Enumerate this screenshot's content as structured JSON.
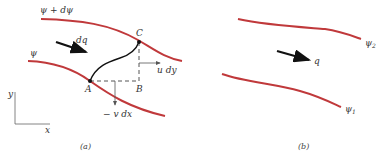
{
  "colors": {
    "streamline": "#c0393b",
    "ink": "#111111",
    "guide": "#555555"
  },
  "panel_a": {
    "caption": "(a)",
    "streamline_upper_label": "ψ + dψ",
    "streamline_lower_label": "ψ",
    "flow_label": "dq",
    "point_a": "A",
    "point_b": "B",
    "point_c": "C",
    "u_component": "u dy",
    "v_component": "− v dx",
    "axis_x": "x",
    "axis_y": "y"
  },
  "panel_b": {
    "caption": "(b)",
    "streamline_upper_label": "ψ",
    "streamline_upper_sub": "2",
    "streamline_lower_label": "ψ",
    "streamline_lower_sub": "1",
    "flow_label": "q"
  }
}
